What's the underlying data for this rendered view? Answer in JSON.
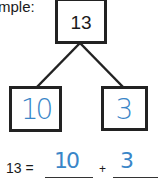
{
  "heading": {
    "label": "mple:"
  },
  "number_bond": {
    "whole": "13",
    "parts": [
      "10",
      "3"
    ]
  },
  "equation": {
    "left": "13 =",
    "operator": "+",
    "answers": [
      "10",
      "3"
    ]
  },
  "colors": {
    "ink": "#222222",
    "handwriting": "#3a86c8"
  }
}
